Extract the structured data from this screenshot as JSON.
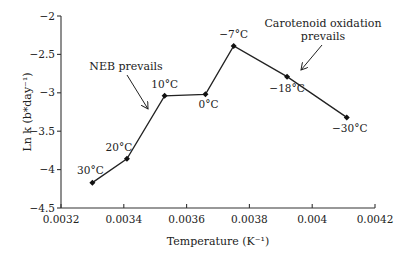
{
  "chart_data": {
    "type": "line",
    "title": "",
    "xlabel": "Temperature (K⁻¹)",
    "ylabel": "Ln k (b*day⁻¹)",
    "xlim": [
      0.0032,
      0.0042
    ],
    "ylim": [
      -4.5,
      -2
    ],
    "grid": false,
    "legend": null,
    "x_ticks": [
      0.0032,
      0.0034,
      0.0036,
      0.0038,
      0.004,
      0.0042
    ],
    "x_tick_labels": [
      "0.0032",
      "0.0034",
      "0.0036",
      "0.0038",
      "0.004",
      "0.0042"
    ],
    "y_ticks": [
      -2,
      -2.5,
      -3,
      -3.5,
      -4,
      -4.5
    ],
    "y_tick_labels": [
      "−2",
      "−2.5",
      "−3",
      "−3.5",
      "−4",
      "−4.5"
    ],
    "series": [
      {
        "name": "Ln k vs 1/T",
        "x": [
          0.0033,
          0.00341,
          0.00353,
          0.00366,
          0.00375,
          0.00392,
          0.00411
        ],
        "values": [
          -4.17,
          -3.86,
          -3.04,
          -3.02,
          -2.39,
          -2.79,
          -3.32
        ],
        "point_labels": [
          "30°C",
          "20°C",
          "10°C",
          "0°C",
          "−7°C",
          "−18°C",
          "−30°C"
        ]
      }
    ],
    "annotations": [
      {
        "text": "NEB prevails",
        "lines": [
          "NEB prevails"
        ]
      },
      {
        "text": "Carotenoid oxidation prevails",
        "lines": [
          "Carotenoid oxidation",
          "prevails"
        ]
      }
    ]
  }
}
